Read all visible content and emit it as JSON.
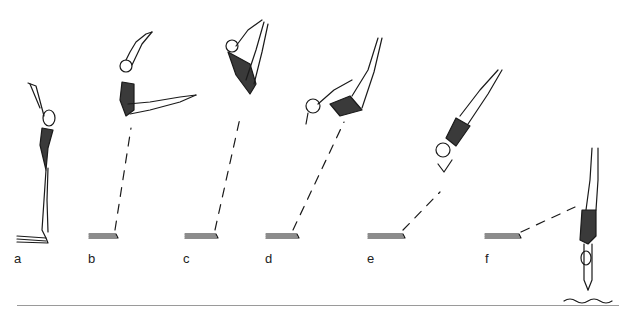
{
  "figure": {
    "stage_labels": [
      "a",
      "b",
      "c",
      "d",
      "e",
      "f"
    ],
    "colors": {
      "ink": "#1a1a1a",
      "suit": "#3a3a3a",
      "rule": "#9a9a9a"
    }
  }
}
